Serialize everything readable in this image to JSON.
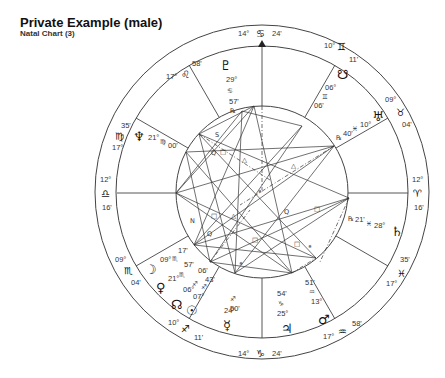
{
  "header": {
    "title": "Private Example (male)",
    "subtitle": "Natal Chart (3)"
  },
  "wheel": {
    "center": [
      262,
      192
    ],
    "radius_outer": 167,
    "radius_zodiac": 146,
    "radius_aspect": 86
  },
  "cusps": [
    {
      "house": 1,
      "label": "ASC",
      "deg": "12°",
      "sign": "Libra",
      "glyph": "♎",
      "min": "16'"
    },
    {
      "house": 2,
      "deg": "09°",
      "sign": "Scorpio",
      "glyph": "♏",
      "min": "04'"
    },
    {
      "house": 3,
      "deg": "10°",
      "sign": "Sagittarius",
      "glyph": "♐",
      "min": "11'"
    },
    {
      "house": 4,
      "label": "IC",
      "deg": "14°",
      "sign": "Capricorn",
      "glyph": "♑",
      "min": "24'"
    },
    {
      "house": 5,
      "deg": "17°",
      "sign": "Aquarius",
      "glyph": "♒",
      "min": "58'"
    },
    {
      "house": 6,
      "deg": "17°",
      "sign": "Pisces",
      "glyph": "♓",
      "min": "35'"
    },
    {
      "house": 7,
      "label": "DSC",
      "deg": "12°",
      "sign": "Aries",
      "glyph": "♈",
      "min": "16'"
    },
    {
      "house": 8,
      "deg": "09°",
      "sign": "Taurus",
      "glyph": "♉",
      "min": "04'"
    },
    {
      "house": 9,
      "deg": "10°",
      "sign": "Gemini",
      "glyph": "♊",
      "min": "11'"
    },
    {
      "house": 10,
      "label": "MC",
      "deg": "14°",
      "sign": "Cancer",
      "glyph": "♋",
      "min": "24'"
    },
    {
      "house": 11,
      "deg": "17°",
      "sign": "Leo",
      "glyph": "♌",
      "min": "58'"
    },
    {
      "house": 12,
      "deg": "17°",
      "sign": "Virgo",
      "glyph": "♍",
      "min": "35'"
    }
  ],
  "planets": [
    {
      "name": "Pluto",
      "glyph": "♇",
      "deg": "29°",
      "sign_glyph": "♋",
      "min": "57'",
      "retro": "℞"
    },
    {
      "name": "North Node",
      "glyph": "☋",
      "deg": "06°",
      "sign_glyph": "♊",
      "min": "06'"
    },
    {
      "name": "Uranus",
      "glyph": "♅",
      "deg": "10°",
      "sign_glyph": "♓",
      "min": "40'",
      "retro": "℞"
    },
    {
      "name": "Neptune",
      "glyph": "♆",
      "deg": "21°",
      "sign_glyph": "♍",
      "min": "00'"
    },
    {
      "name": "Saturn",
      "glyph": "♄",
      "deg": "28°",
      "sign_glyph": "♓",
      "min": "21'",
      "retro": "℞"
    },
    {
      "name": "Moon",
      "glyph": "☽",
      "deg": "09°",
      "sign_glyph": "♏",
      "min": "17'"
    },
    {
      "name": "Venus",
      "glyph": "♀",
      "deg": "21°",
      "sign_glyph": "♏",
      "min": "57'"
    },
    {
      "name": "South Node",
      "glyph": "☊",
      "deg": "06°",
      "sign_glyph": "♐",
      "min": "06'"
    },
    {
      "name": "Sun",
      "glyph": "☉",
      "deg": "07°",
      "sign_glyph": "♐",
      "min": "43'"
    },
    {
      "name": "Mercury",
      "glyph": "☿",
      "deg": "24°",
      "sign_glyph": "♐",
      "min": "50'"
    },
    {
      "name": "Jupiter",
      "glyph": "♃",
      "deg": "25°",
      "sign_glyph": "♑",
      "min": "54'"
    },
    {
      "name": "Mars",
      "glyph": "♂",
      "deg": "13°",
      "sign_glyph": "♒",
      "min": "51'"
    }
  ],
  "aspect_symbols": [
    "S",
    "Q",
    "□",
    "△",
    "N",
    "Q",
    "□",
    "△",
    "⚹",
    "□",
    "Q",
    "⚹"
  ]
}
